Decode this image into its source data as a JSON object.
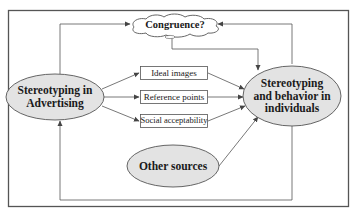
{
  "diagram": {
    "type": "flow-diagram",
    "colors": {
      "frame": "#555555",
      "ellipse_fill": "#e3e3e3",
      "ellipse_stroke": "#555555",
      "box_fill": "#ffffff",
      "line": "#555555",
      "text": "#1a1a1a"
    },
    "nodes": {
      "congruence": {
        "label": "Congruence?",
        "shape": "cloud"
      },
      "advertising": {
        "label": "Stereotyping in Advertising",
        "line1": "Stereotyping in",
        "line2": "Advertising",
        "shape": "ellipse"
      },
      "individuals": {
        "label": "Stereotyping and behavior in individuals",
        "line1": "Stereotyping",
        "line2": "and behavior in",
        "line3": "individuals",
        "shape": "ellipse"
      },
      "other": {
        "label": "Other sources",
        "shape": "ellipse"
      },
      "ideal": {
        "label": "Ideal images",
        "shape": "box"
      },
      "reference": {
        "label": "Reference points",
        "shape": "box"
      },
      "social": {
        "label": "Social acceptability",
        "shape": "box"
      }
    },
    "edges": [
      {
        "from": "advertising",
        "to": "ideal"
      },
      {
        "from": "advertising",
        "to": "reference"
      },
      {
        "from": "advertising",
        "to": "social"
      },
      {
        "from": "ideal",
        "to": "individuals"
      },
      {
        "from": "reference",
        "to": "individuals"
      },
      {
        "from": "social",
        "to": "individuals"
      },
      {
        "from": "other",
        "to": "individuals"
      },
      {
        "from": "advertising",
        "to": "congruence"
      },
      {
        "from": "individuals",
        "to": "congruence"
      },
      {
        "from": "congruence",
        "to": "individuals"
      },
      {
        "from": "individuals",
        "to": "advertising",
        "via": "bottom loop"
      }
    ]
  }
}
